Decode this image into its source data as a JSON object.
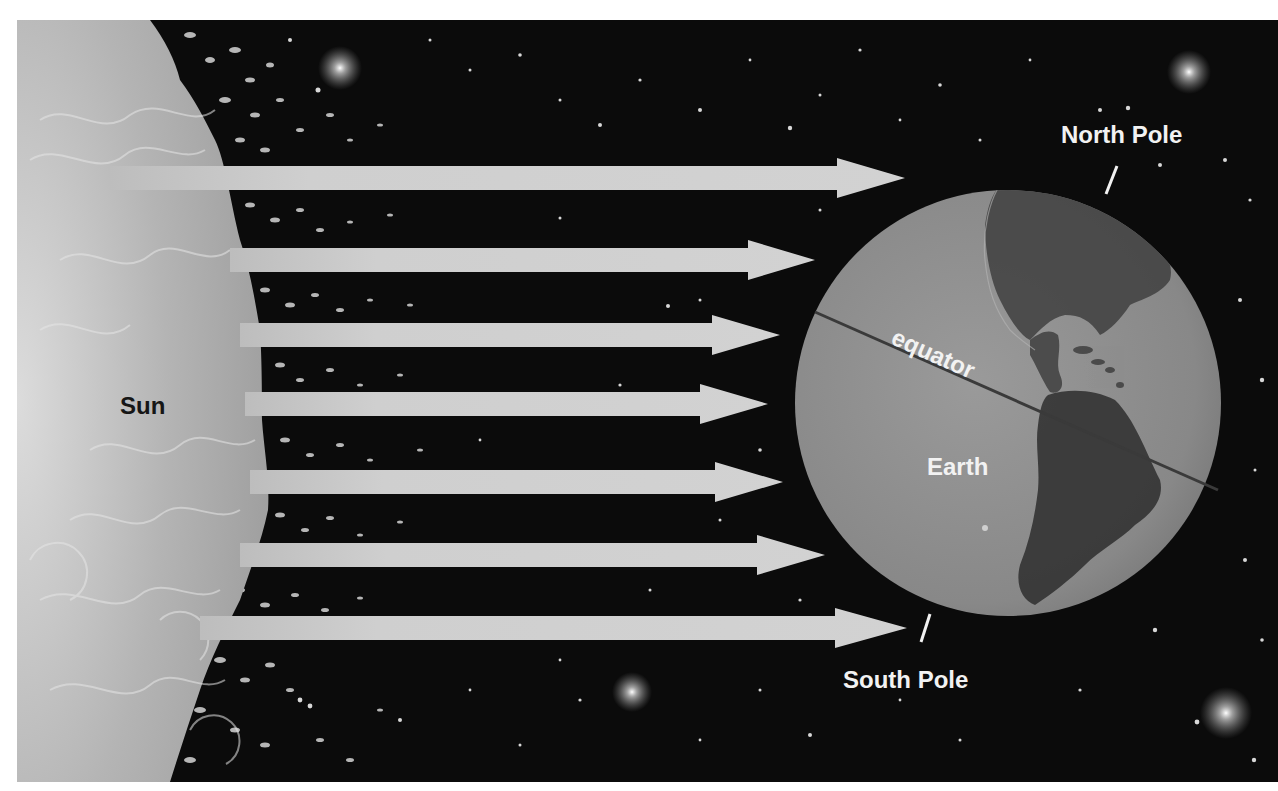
{
  "diagram": {
    "type": "illustration",
    "labels": {
      "sun": "Sun",
      "earth": "Earth",
      "equator": "equator",
      "north_pole": "North Pole",
      "south_pole": "South Pole"
    },
    "arrows": [
      {
        "y": 178,
        "tip_x": 905
      },
      {
        "y": 260,
        "tip_x": 815
      },
      {
        "y": 335,
        "tip_x": 780
      },
      {
        "y": 404,
        "tip_x": 768
      },
      {
        "y": 482,
        "tip_x": 783
      },
      {
        "y": 555,
        "tip_x": 825
      },
      {
        "y": 628,
        "tip_x": 907
      }
    ],
    "colors": {
      "space": "#0b0b0b",
      "sun_light": "#d6d6d6",
      "sun_mid": "#a9a9a9",
      "arrow": "#cfcfcf",
      "earth_ocean": "#8c8c8c",
      "earth_land": "#3e3e3e",
      "equator_line": "#3a3a3a",
      "label_light": "#f2f2f2",
      "label_dark": "#161616"
    }
  }
}
